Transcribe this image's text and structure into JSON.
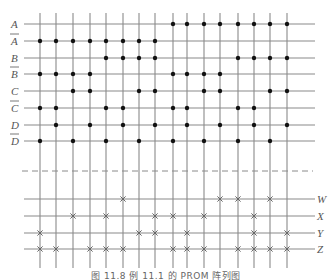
{
  "figure": {
    "caption": "图 11.8 例 11.1 的 PROM 阵列图"
  },
  "colors": {
    "line": "#8a8a8a",
    "dot": "#111111",
    "xmark": "#666666",
    "label": "#555555"
  },
  "layout": {
    "columns_x": [
      40,
      56,
      73,
      90,
      106,
      123,
      139,
      155,
      173,
      187,
      204,
      220,
      238,
      254,
      270,
      287
    ],
    "vertical_top": 13,
    "vertical_bottom": 268,
    "hline_left": 24,
    "hline_right": 315,
    "dashed_y": 171,
    "dashed_left": 22,
    "dashed_right": 313
  },
  "and_array": {
    "rows": [
      {
        "label": "A",
        "bar": false,
        "y": 24,
        "dots": [
          9,
          10,
          11,
          12,
          13,
          14,
          15,
          16
        ]
      },
      {
        "label": "A",
        "bar": true,
        "y": 41,
        "dots": [
          1,
          2,
          3,
          4,
          5,
          6,
          7,
          8
        ]
      },
      {
        "label": "B",
        "bar": false,
        "y": 58,
        "dots": [
          5,
          6,
          7,
          8,
          13,
          14,
          15,
          16
        ]
      },
      {
        "label": "B",
        "bar": true,
        "y": 74,
        "dots": [
          1,
          2,
          3,
          4,
          9,
          10,
          11,
          12
        ]
      },
      {
        "label": "C",
        "bar": false,
        "y": 91,
        "dots": [
          3,
          4,
          7,
          8,
          11,
          12,
          15,
          16
        ]
      },
      {
        "label": "C",
        "bar": true,
        "y": 108,
        "dots": [
          1,
          2,
          5,
          6,
          9,
          10,
          13,
          14
        ]
      },
      {
        "label": "D",
        "bar": false,
        "y": 125,
        "dots": [
          2,
          4,
          6,
          8,
          10,
          12,
          14,
          16
        ]
      },
      {
        "label": "D",
        "bar": true,
        "y": 141,
        "dots": [
          1,
          3,
          5,
          7,
          9,
          11,
          13,
          15
        ]
      }
    ]
  },
  "or_array": {
    "rows": [
      {
        "label": "W",
        "y": 199,
        "marks": [
          6,
          12,
          13,
          15
        ]
      },
      {
        "label": "X",
        "y": 216,
        "marks": [
          3,
          5,
          8,
          9,
          11,
          14
        ]
      },
      {
        "label": "Y",
        "y": 233,
        "marks": [
          1,
          7,
          8,
          10,
          14,
          16
        ]
      },
      {
        "label": "Z",
        "y": 249,
        "marks": [
          1,
          2,
          4,
          5,
          6,
          9,
          10,
          11,
          13,
          14,
          15,
          16
        ]
      }
    ]
  }
}
